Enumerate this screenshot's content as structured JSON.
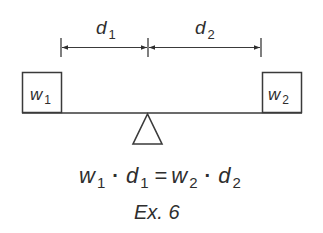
{
  "figure": {
    "caption": "Ex. 6",
    "colors": {
      "ink": "#2e2e2e",
      "stroke": "#3a3a3a",
      "background": "#ffffff"
    }
  },
  "dimensions": {
    "d1": {
      "var": "d",
      "sub": "1"
    },
    "d2": {
      "var": "d",
      "sub": "2"
    }
  },
  "weights": {
    "w1": {
      "var": "w",
      "sub": "1"
    },
    "w2": {
      "var": "w",
      "sub": "2"
    }
  },
  "equation": {
    "terms": [
      {
        "var": "w",
        "sub": "1"
      },
      {
        "op": "·"
      },
      {
        "var": "d",
        "sub": "1"
      },
      {
        "op": "="
      },
      {
        "var": "w",
        "sub": "2"
      },
      {
        "op": "·"
      },
      {
        "var": "d",
        "sub": "2"
      }
    ]
  },
  "diagram_data": {
    "type": "lever-balance",
    "elements": [
      "weight w1 (left)",
      "weight w2 (right)",
      "beam",
      "fulcrum (triangle)",
      "dimension d1 (w1 to fulcrum)",
      "dimension d2 (fulcrum to w2)"
    ],
    "relation": "w1 · d1 = w2 · d2"
  }
}
